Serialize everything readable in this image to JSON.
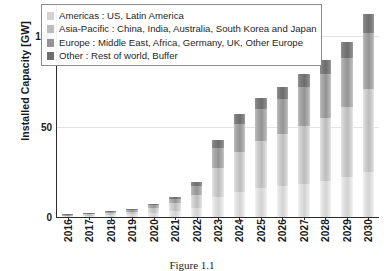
{
  "figure": {
    "caption": "Figure 1.1"
  },
  "axes": {
    "y_title": "Installed Capacity [GW]",
    "y_ticks": [
      "0",
      "50",
      "100"
    ],
    "x_ticks": [
      "2016",
      "2017",
      "2018",
      "2019",
      "2020",
      "2021",
      "2022",
      "2023",
      "2024",
      "2025",
      "2026",
      "2027",
      "2028",
      "2029",
      "2030"
    ]
  },
  "legend": {
    "position": "top-left-inside",
    "entries": [
      {
        "label": "Americas : US, Latin America",
        "color": "#d3d3d3",
        "swatch_name": "legend-swatch-americas"
      },
      {
        "label": "Asia-Pacific : China, India, Australia, South Korea and Japan",
        "color": "#bcbcbc",
        "swatch_name": "legend-swatch-asia-pacific"
      },
      {
        "label": "Europe : Middle East, Africa, Germany, UK, Other Europe",
        "color": "#949494",
        "swatch_name": "legend-swatch-europe"
      },
      {
        "label": "Other : Rest of world, Buffer",
        "color": "#6d6d6d",
        "swatch_name": "legend-swatch-other"
      }
    ]
  },
  "chart_data": {
    "type": "bar",
    "subtype": "stacked-vertical",
    "title": "",
    "xlabel": "",
    "ylabel": "Installed Capacity [GW]",
    "ylim": [
      0,
      118
    ],
    "yticks": [
      0,
      50,
      100
    ],
    "grid": true,
    "grid_axis": "y",
    "legend_position": "upper left",
    "categories": [
      "2016",
      "2017",
      "2018",
      "2019",
      "2020",
      "2021",
      "2022",
      "2023",
      "2024",
      "2025",
      "2026",
      "2027",
      "2028",
      "2029",
      "2030"
    ],
    "series": [
      {
        "name": "Americas : US, Latin America",
        "short_name": "Americas",
        "color": "#d3d3d3",
        "values": [
          0.5,
          0.8,
          1.2,
          1.6,
          2.5,
          3.5,
          5.0,
          11.0,
          14.0,
          16.0,
          17.0,
          18.5,
          20.0,
          22.0,
          25.0
        ]
      },
      {
        "name": "Asia-Pacific : China, India, Australia, South Korea and Japan",
        "short_name": "Asia-Pacific",
        "color": "#bcbcbc",
        "values": [
          0.3,
          0.7,
          1.0,
          1.4,
          2.5,
          4.0,
          7.0,
          16.0,
          22.0,
          26.0,
          29.0,
          32.0,
          35.0,
          39.0,
          46.0
        ]
      },
      {
        "name": "Europe : Middle East, Africa, Germany, UK, Other Europe",
        "short_name": "Europe",
        "color": "#949494",
        "values": [
          0.2,
          0.4,
          0.6,
          0.8,
          1.5,
          2.5,
          5.0,
          11.0,
          15.5,
          18.0,
          19.5,
          21.5,
          24.0,
          27.0,
          31.0
        ]
      },
      {
        "name": "Other : Rest of world, Buffer",
        "short_name": "Other",
        "color": "#6d6d6d",
        "values": [
          0.1,
          0.2,
          0.3,
          0.4,
          0.7,
          1.2,
          2.2,
          4.5,
          5.8,
          6.2,
          6.8,
          7.2,
          8.0,
          9.0,
          10.5
        ]
      }
    ],
    "totals": [
      1.1,
      2.1,
      3.1,
      4.2,
      7.2,
      11.2,
      19.2,
      42.5,
      57.3,
      66.2,
      72.3,
      79.2,
      87.0,
      97.0,
      112.5
    ]
  }
}
